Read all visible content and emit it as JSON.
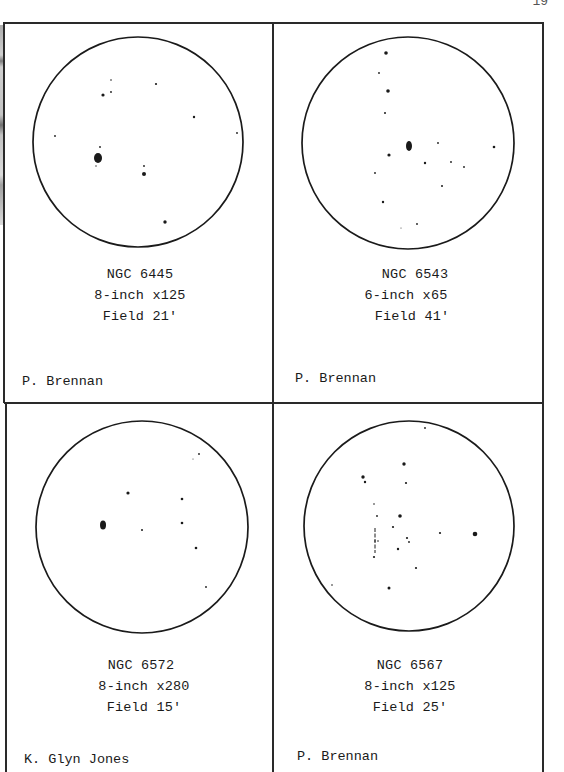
{
  "page": {
    "page_number": "19"
  },
  "panels": [
    {
      "object": "NGC 6445",
      "instrument": "8-inch x125",
      "field": "Field 21'",
      "observer": "P. Brennan",
      "circle": {
        "cx": 138,
        "cy": 142,
        "r": 105
      },
      "stars": [
        {
          "x": 111,
          "y": 80,
          "s": 0.8
        },
        {
          "x": 103,
          "y": 95,
          "s": 1.6
        },
        {
          "x": 111,
          "y": 92,
          "s": 0.9
        },
        {
          "x": 156,
          "y": 84,
          "s": 1.1
        },
        {
          "x": 194,
          "y": 117,
          "s": 1.2
        },
        {
          "x": 55,
          "y": 136,
          "s": 0.9
        },
        {
          "x": 237,
          "y": 133,
          "s": 0.9
        },
        {
          "x": 100,
          "y": 147,
          "s": 0.9
        },
        {
          "x": 98,
          "y": 158,
          "s": 4,
          "ry": 5,
          "label": "nebula"
        },
        {
          "x": 96,
          "y": 166,
          "s": 0.7
        },
        {
          "x": 144,
          "y": 166,
          "s": 0.9
        },
        {
          "x": 144,
          "y": 174,
          "s": 2
        },
        {
          "x": 165,
          "y": 222,
          "s": 1.7
        }
      ],
      "lines": []
    },
    {
      "object": "NGC 6543",
      "instrument": "6-inch x65",
      "field": "Field 41'",
      "observer": "P. Brennan",
      "circle": {
        "cx": 408,
        "cy": 143,
        "r": 106
      },
      "stars": [
        {
          "x": 386,
          "y": 53,
          "s": 1.8
        },
        {
          "x": 379,
          "y": 73,
          "s": 0.9
        },
        {
          "x": 388,
          "y": 91,
          "s": 1.8
        },
        {
          "x": 385,
          "y": 113,
          "s": 1
        },
        {
          "x": 409,
          "y": 146,
          "s": 3,
          "ry": 5,
          "label": "nebula"
        },
        {
          "x": 438,
          "y": 143,
          "s": 0.9
        },
        {
          "x": 494,
          "y": 147,
          "s": 1.3
        },
        {
          "x": 389,
          "y": 155,
          "s": 1.6
        },
        {
          "x": 425,
          "y": 163,
          "s": 1.2
        },
        {
          "x": 451,
          "y": 162,
          "s": 0.9
        },
        {
          "x": 464,
          "y": 167,
          "s": 0.9
        },
        {
          "x": 375,
          "y": 173,
          "s": 0.9
        },
        {
          "x": 442,
          "y": 186,
          "s": 1
        },
        {
          "x": 383,
          "y": 202,
          "s": 1.2
        },
        {
          "x": 417,
          "y": 224,
          "s": 0.9
        },
        {
          "x": 401,
          "y": 228,
          "s": 0.5
        }
      ],
      "lines": []
    },
    {
      "object": "NGC 6572",
      "instrument": "8-inch x280",
      "field": "Field 15'",
      "observer": "K. Glyn Jones",
      "circle": {
        "cx": 142,
        "cy": 527,
        "r": 106
      },
      "stars": [
        {
          "x": 199,
          "y": 454,
          "s": 0.9
        },
        {
          "x": 193,
          "y": 459,
          "s": 0.5
        },
        {
          "x": 128,
          "y": 493,
          "s": 1.6
        },
        {
          "x": 182,
          "y": 499,
          "s": 1.3
        },
        {
          "x": 103,
          "y": 525,
          "s": 3,
          "ry": 4.5,
          "label": "nebula"
        },
        {
          "x": 142,
          "y": 530,
          "s": 1
        },
        {
          "x": 182,
          "y": 523,
          "s": 1.3
        },
        {
          "x": 196,
          "y": 548,
          "s": 1.3
        },
        {
          "x": 206,
          "y": 587,
          "s": 0.9
        }
      ],
      "lines": []
    },
    {
      "object": "NGC 6567",
      "instrument": "8-inch x125",
      "field": "Field 25'",
      "observer": "P. Brennan",
      "circle": {
        "cx": 409,
        "cy": 526,
        "r": 105
      },
      "stars": [
        {
          "x": 425,
          "y": 428,
          "s": 0.9
        },
        {
          "x": 404,
          "y": 464,
          "s": 1.7
        },
        {
          "x": 363,
          "y": 477,
          "s": 1.7
        },
        {
          "x": 365,
          "y": 482,
          "s": 1.2
        },
        {
          "x": 406,
          "y": 483,
          "s": 1.1
        },
        {
          "x": 374,
          "y": 504,
          "s": 0.8
        },
        {
          "x": 400,
          "y": 516,
          "s": 1.8
        },
        {
          "x": 377,
          "y": 516,
          "s": 0.9
        },
        {
          "x": 393,
          "y": 527,
          "s": 1.1
        },
        {
          "x": 475,
          "y": 534,
          "s": 2.3,
          "label": "nebula"
        },
        {
          "x": 440,
          "y": 533,
          "s": 1.1
        },
        {
          "x": 407,
          "y": 538,
          "s": 1.1
        },
        {
          "x": 409,
          "y": 542,
          "s": 0.9
        },
        {
          "x": 375,
          "y": 541,
          "s": 0.8
        },
        {
          "x": 378,
          "y": 541,
          "s": 0.8
        },
        {
          "x": 398,
          "y": 549,
          "s": 1.2
        },
        {
          "x": 374,
          "y": 557,
          "s": 1.1
        },
        {
          "x": 416,
          "y": 568,
          "s": 1.1
        },
        {
          "x": 332,
          "y": 585,
          "s": 0.8
        },
        {
          "x": 389,
          "y": 588,
          "s": 1.5
        }
      ],
      "lines": [
        {
          "x1": 375,
          "y1": 528,
          "x2": 375,
          "y2": 553
        }
      ]
    }
  ],
  "colors": {
    "ink": "#1a1a1a",
    "paper": "#ffffff",
    "border": "#2a2a2a"
  }
}
